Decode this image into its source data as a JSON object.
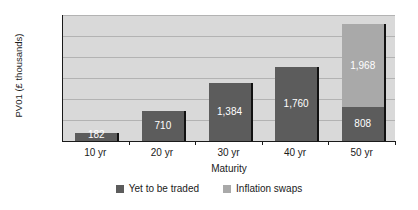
{
  "chart_data": {
    "type": "bar",
    "subtype": "stacked-vertical-bar",
    "title": "",
    "xlabel": "Maturity",
    "ylabel": "PV01 (£ thousands)",
    "categories": [
      "10 yr",
      "20 yr",
      "30 yr",
      "40 yr",
      "50 yr"
    ],
    "series": [
      {
        "name": "Yet to be traded",
        "color": "#5c5c5c",
        "values": [
          182,
          710,
          1384,
          1760,
          808
        ],
        "labels": [
          "182",
          "710",
          "1,384",
          "1,760",
          "808"
        ]
      },
      {
        "name": "Inflation swaps",
        "color": "#a9a9a9",
        "values": [
          0,
          0,
          0,
          0,
          1968
        ],
        "labels": [
          "",
          "",
          "",
          "",
          "1,968"
        ]
      }
    ],
    "totals": [
      182,
      710,
      1384,
      1760,
      2776
    ],
    "ylim": [
      0,
      3000
    ],
    "yticks": [
      0,
      500,
      1000,
      1500,
      2000,
      2500,
      3000
    ],
    "ytick_labels": [
      "0",
      "500",
      "1,000",
      "1,500",
      "2,000",
      "2,500",
      "3,000"
    ],
    "grid": "horizontal",
    "legend_position": "bottom",
    "plot_background": "#d9d9d9",
    "page_background": "#ffffff"
  },
  "legend": {
    "items": [
      {
        "label": "Yet to be traded",
        "color": "#5c5c5c"
      },
      {
        "label": "Inflation swaps",
        "color": "#a9a9a9"
      }
    ]
  }
}
